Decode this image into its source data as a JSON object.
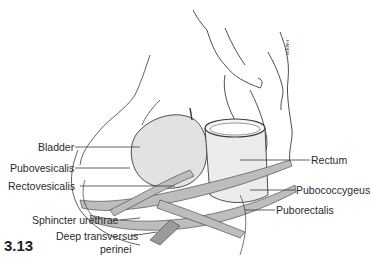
{
  "figure": {
    "number": "3.13",
    "signature": "HADER"
  },
  "labels_left": [
    {
      "id": "bladder",
      "text": "Bladder"
    },
    {
      "id": "pubovesicalis",
      "text": "Pubovesicalis"
    },
    {
      "id": "rectovesicalis",
      "text": "Rectovesicalis"
    },
    {
      "id": "sphincter-urethrae",
      "text": "Sphincter urethrae"
    },
    {
      "id": "deep-transversus-perinei-1",
      "text": "Deep transversus"
    },
    {
      "id": "deep-transversus-perinei-2",
      "text": "perinei"
    }
  ],
  "labels_right": [
    {
      "id": "rectum",
      "text": "Rectum"
    },
    {
      "id": "pubococcygeus",
      "text": "Pubococcygeus"
    },
    {
      "id": "puborectalis",
      "text": "Puborectalis"
    }
  ],
  "colors": {
    "line": "#3a3a3a",
    "shade": "#bdbdbd",
    "light": "#e6e6e6"
  }
}
